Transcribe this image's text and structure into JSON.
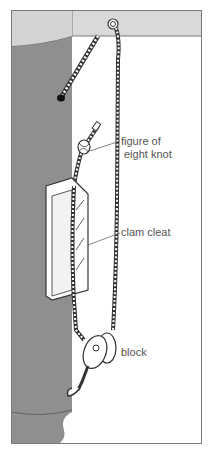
{
  "diagram": {
    "labels": {
      "knot_line1": "figure of",
      "knot_line2": "eight knot",
      "cleat": "clam cleat",
      "block": "block"
    },
    "colors": {
      "mast": "#8f8f8f",
      "header": "#d9d9d9",
      "border": "#7a7a7a",
      "rope_outline": "#333333",
      "rope_fill": "#ffffff",
      "label_text": "#555555"
    }
  }
}
